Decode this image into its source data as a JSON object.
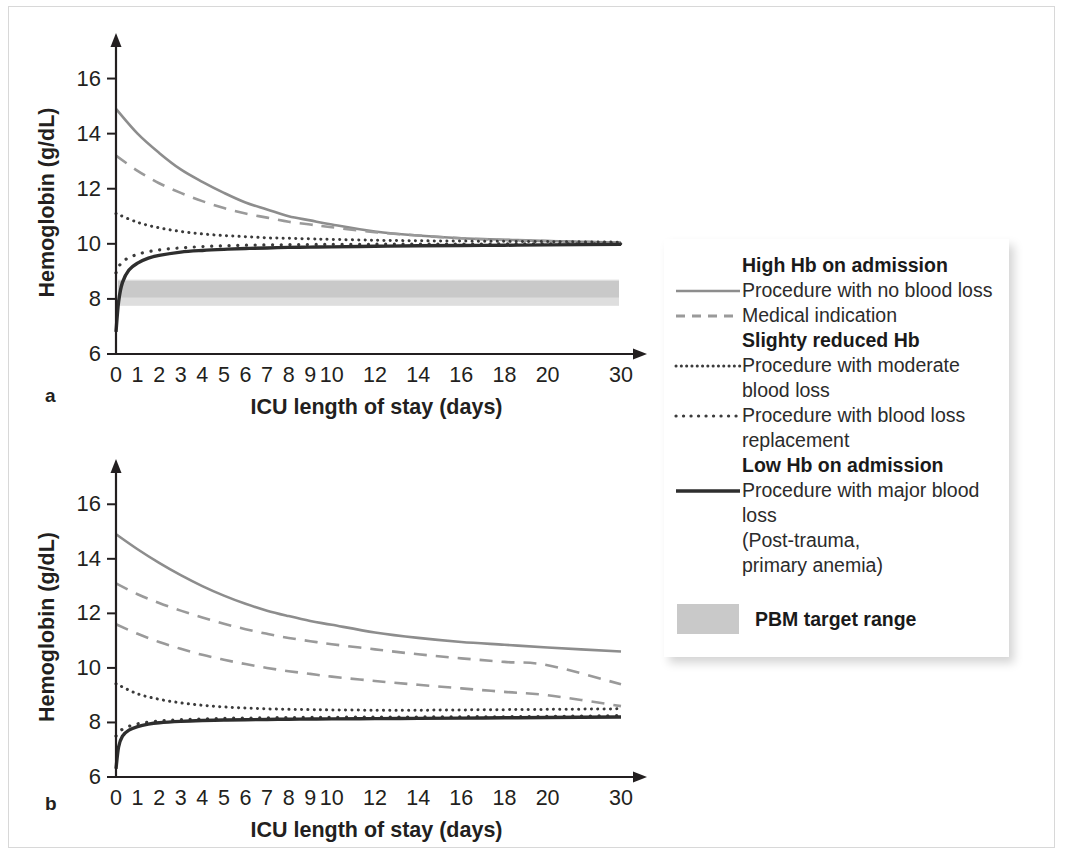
{
  "figure": {
    "panels": [
      {
        "letter": "a",
        "xlabel": "ICU length of stay (days)",
        "ylabel": "Hemoglobin (g/dL)",
        "yticks": [
          6,
          8,
          10,
          12,
          14,
          16
        ],
        "ylim": [
          6,
          17
        ],
        "xticks": [
          0,
          1,
          2,
          3,
          4,
          5,
          6,
          7,
          8,
          9,
          10,
          12,
          14,
          16,
          18,
          20,
          30
        ],
        "has_target_band": true,
        "target_band": {
          "low": 7.75,
          "high": 8.7,
          "inner_low": 8.05,
          "label": "PBM target range"
        }
      },
      {
        "letter": "b",
        "xlabel": "ICU length of stay (days)",
        "ylabel": "Hemoglobin (g/dL)",
        "yticks": [
          6,
          8,
          10,
          12,
          14,
          16
        ],
        "ylim": [
          6,
          17
        ],
        "xticks": [
          0,
          1,
          2,
          3,
          4,
          5,
          6,
          7,
          8,
          9,
          10,
          12,
          14,
          16,
          18,
          20,
          30
        ],
        "has_target_band": false
      }
    ]
  },
  "chart_data": [
    {
      "type": "line",
      "panel": "a",
      "title": "",
      "xlabel": "ICU length of stay (days)",
      "ylabel": "Hemoglobin (g/dL)",
      "xlim": [
        0,
        30
      ],
      "ylim": [
        6,
        17
      ],
      "yticks": [
        6,
        8,
        10,
        12,
        14,
        16
      ],
      "xticks": [
        0,
        1,
        2,
        3,
        4,
        5,
        6,
        7,
        8,
        9,
        10,
        12,
        14,
        16,
        18,
        20,
        30
      ],
      "grid": false,
      "legend_position": "right-external",
      "shaded_band": {
        "name": "PBM target range",
        "ymin": 7.75,
        "ymax": 8.7,
        "color": "#c9c9c9"
      },
      "series": [
        {
          "name": "Procedure with no blood loss",
          "group": "High Hb on admission",
          "style": "solid",
          "color": "#8d8d8d",
          "width": 2.6,
          "x": [
            0,
            1,
            2,
            3,
            4,
            5,
            6,
            7,
            8,
            9,
            10,
            12,
            14,
            16,
            18,
            20,
            30
          ],
          "y": [
            14.9,
            14.0,
            13.3,
            12.7,
            12.25,
            11.85,
            11.5,
            11.25,
            11.0,
            10.85,
            10.7,
            10.45,
            10.3,
            10.2,
            10.15,
            10.1,
            10.05
          ]
        },
        {
          "name": "Medical indication",
          "group": "High Hb on admission",
          "style": "dashed",
          "color": "#9a9a9a",
          "width": 2.6,
          "x": [
            0,
            1,
            2,
            3,
            4,
            5,
            6,
            7,
            8,
            9,
            10,
            12,
            14,
            16,
            18,
            20,
            30
          ],
          "y": [
            13.2,
            12.65,
            12.2,
            11.85,
            11.55,
            11.3,
            11.1,
            10.95,
            10.8,
            10.7,
            10.6,
            10.42,
            10.3,
            10.2,
            10.14,
            10.1,
            10.04
          ]
        },
        {
          "name": "Procedure with moderate blood loss",
          "group": "Slighty reduced Hb",
          "style": "dotted-fine",
          "color": "#3b3b3b",
          "width": 3.0,
          "x": [
            0,
            1,
            2,
            3,
            4,
            5,
            6,
            7,
            8,
            9,
            10,
            12,
            14,
            16,
            18,
            20,
            30
          ],
          "y": [
            11.1,
            10.78,
            10.58,
            10.45,
            10.36,
            10.3,
            10.26,
            10.22,
            10.2,
            10.18,
            10.16,
            10.13,
            10.11,
            10.1,
            10.09,
            10.08,
            10.06
          ]
        },
        {
          "name": "Procedure with blood loss replacement",
          "group": "Slighty reduced Hb",
          "style": "dotted-coarse",
          "color": "#3b3b3b",
          "width": 3.2,
          "x": [
            0,
            0.3,
            1,
            2,
            3,
            4,
            5,
            6,
            7,
            8,
            9,
            10,
            12,
            14,
            16,
            18,
            20,
            30
          ],
          "y": [
            8.95,
            9.35,
            9.62,
            9.78,
            9.85,
            9.9,
            9.93,
            9.95,
            9.96,
            9.97,
            9.975,
            9.98,
            9.985,
            9.99,
            9.99,
            9.995,
            9.995,
            10.0
          ]
        },
        {
          "name": "Procedure with major blood loss",
          "group": "Low Hb on admission",
          "style": "solid-thick",
          "color": "#2e2e2e",
          "width": 3.4,
          "x": [
            0,
            0.12,
            0.3,
            0.6,
            1,
            1.5,
            2,
            3,
            4,
            5,
            6,
            7,
            8,
            9,
            10,
            12,
            14,
            16,
            18,
            20,
            30
          ],
          "y": [
            6.8,
            7.9,
            8.6,
            9.05,
            9.3,
            9.48,
            9.58,
            9.7,
            9.76,
            9.8,
            9.83,
            9.85,
            9.87,
            9.88,
            9.89,
            9.91,
            9.93,
            9.94,
            9.95,
            9.96,
            9.98
          ]
        }
      ]
    },
    {
      "type": "line",
      "panel": "b",
      "title": "",
      "xlabel": "ICU length of stay (days)",
      "ylabel": "Hemoglobin (g/dL)",
      "xlim": [
        0,
        30
      ],
      "ylim": [
        6,
        17
      ],
      "yticks": [
        6,
        8,
        10,
        12,
        14,
        16
      ],
      "xticks": [
        0,
        1,
        2,
        3,
        4,
        5,
        6,
        7,
        8,
        9,
        10,
        12,
        14,
        16,
        18,
        20,
        30
      ],
      "grid": false,
      "legend_position": "right-external",
      "shaded_band": null,
      "series": [
        {
          "name": "Procedure with no blood loss",
          "group": "High Hb on admission",
          "style": "solid",
          "color": "#8d8d8d",
          "width": 2.6,
          "x": [
            0,
            1,
            2,
            3,
            4,
            5,
            6,
            7,
            8,
            9,
            10,
            12,
            14,
            16,
            18,
            20,
            30
          ],
          "y": [
            14.9,
            14.35,
            13.85,
            13.4,
            13.0,
            12.65,
            12.35,
            12.1,
            11.9,
            11.72,
            11.58,
            11.3,
            11.1,
            10.95,
            10.85,
            10.75,
            10.6
          ]
        },
        {
          "name": "Medical indication",
          "group": "High Hb on admission",
          "style": "dashed",
          "color": "#9a9a9a",
          "width": 2.6,
          "x": [
            0,
            1,
            2,
            3,
            4,
            5,
            6,
            7,
            8,
            9,
            10,
            12,
            14,
            16,
            18,
            20,
            30
          ],
          "y": [
            13.1,
            12.7,
            12.38,
            12.1,
            11.85,
            11.62,
            11.42,
            11.25,
            11.1,
            10.98,
            10.87,
            10.68,
            10.5,
            10.35,
            10.22,
            10.1,
            9.4
          ]
        },
        {
          "name": "Medical indication (lower)",
          "group": "High Hb on admission",
          "style": "dashed",
          "color": "#9a9a9a",
          "width": 2.6,
          "x": [
            0,
            1,
            2,
            3,
            4,
            5,
            6,
            7,
            8,
            9,
            10,
            12,
            14,
            16,
            18,
            20,
            30
          ],
          "y": [
            11.6,
            11.25,
            10.95,
            10.7,
            10.48,
            10.3,
            10.14,
            10.0,
            9.88,
            9.78,
            9.68,
            9.52,
            9.38,
            9.25,
            9.12,
            9.0,
            8.6
          ]
        },
        {
          "name": "Procedure with moderate blood loss",
          "group": "Slighty reduced Hb",
          "style": "dotted-fine",
          "color": "#3b3b3b",
          "width": 3.0,
          "x": [
            0,
            1,
            2,
            3,
            4,
            5,
            6,
            7,
            8,
            9,
            10,
            12,
            14,
            16,
            18,
            20,
            30
          ],
          "y": [
            9.42,
            9.05,
            8.85,
            8.72,
            8.63,
            8.57,
            8.53,
            8.5,
            8.48,
            8.47,
            8.46,
            8.45,
            8.45,
            8.46,
            8.47,
            8.48,
            8.5
          ]
        },
        {
          "name": "Procedure with blood loss replacement",
          "group": "Slighty reduced Hb",
          "style": "dotted-coarse",
          "color": "#3b3b3b",
          "width": 3.2,
          "x": [
            0,
            0.3,
            1,
            2,
            3,
            4,
            5,
            6,
            7,
            8,
            9,
            10,
            12,
            14,
            16,
            18,
            20,
            30
          ],
          "y": [
            7.5,
            7.75,
            7.95,
            8.05,
            8.1,
            8.13,
            8.15,
            8.16,
            8.17,
            8.18,
            8.185,
            8.19,
            8.2,
            8.2,
            8.21,
            8.21,
            8.22,
            8.25
          ]
        },
        {
          "name": "Procedure with major blood loss",
          "group": "Low Hb on admission",
          "style": "solid-thick",
          "color": "#2e2e2e",
          "width": 3.4,
          "x": [
            0,
            0.12,
            0.3,
            0.6,
            1,
            1.5,
            2,
            3,
            4,
            5,
            6,
            7,
            8,
            9,
            10,
            12,
            14,
            16,
            18,
            20,
            30
          ],
          "y": [
            6.3,
            7.1,
            7.5,
            7.72,
            7.85,
            7.94,
            7.99,
            8.04,
            8.07,
            8.09,
            8.1,
            8.11,
            8.12,
            8.125,
            8.13,
            8.14,
            8.15,
            8.16,
            8.17,
            8.18,
            8.2
          ]
        }
      ]
    }
  ],
  "legend": {
    "entries": [
      {
        "kind": "header",
        "label": "High Hb on admission"
      },
      {
        "kind": "line",
        "style": "solid",
        "label": "Procedure with no blood loss"
      },
      {
        "kind": "line",
        "style": "dashed",
        "label": "Medical indication"
      },
      {
        "kind": "header",
        "label": "Slighty reduced Hb"
      },
      {
        "kind": "line",
        "style": "dotted-fine",
        "label": "Procedure with moderate",
        "cont": "blood loss"
      },
      {
        "kind": "line",
        "style": "dotted-coarse",
        "label": "Procedure with blood loss",
        "cont": "replacement"
      },
      {
        "kind": "header",
        "label": "Low Hb on admission"
      },
      {
        "kind": "line",
        "style": "solid-thick",
        "label": "Procedure with major blood",
        "cont": "loss",
        "cont2": "(Post-trauma,",
        "cont3": "primary anemia)"
      },
      {
        "kind": "swatch",
        "label": "PBM target range",
        "color": "#c9c9c9"
      }
    ]
  },
  "colors": {
    "axis": "#231f20",
    "light_gray_line": "#8d8d8d",
    "dark_line": "#2e2e2e",
    "band": "#c9c9c9",
    "band_light": "#dedede",
    "frame": "#d8d8d8",
    "text": "#231f20"
  }
}
